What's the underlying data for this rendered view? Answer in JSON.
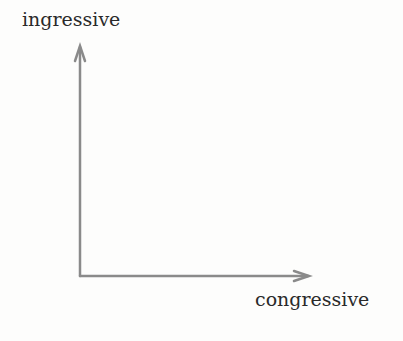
{
  "diagram": {
    "y_axis": {
      "label": "ingressive"
    },
    "x_axis": {
      "label": "congressive"
    },
    "axis_color": "#8a8a8a"
  }
}
